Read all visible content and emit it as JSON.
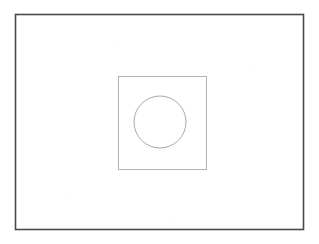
{
  "figure": {
    "background_color": "#ffffff",
    "canvas": {
      "width": 319,
      "height": 244
    },
    "shapes": [
      {
        "name": "outer-rectangle",
        "type": "rect",
        "x": 15.5,
        "y": 14.5,
        "width": 288,
        "height": 215,
        "stroke_color": "#4a4a4a",
        "stroke_width": 1.6,
        "fill": "none"
      },
      {
        "name": "inner-square",
        "type": "rect",
        "x": 118.5,
        "y": 76.5,
        "width": 88,
        "height": 93,
        "stroke_color": "#b2b2b2",
        "stroke_width": 1.0,
        "fill": "none"
      },
      {
        "name": "inner-circle",
        "type": "circle",
        "cx": 160,
        "cy": 122,
        "r": 26,
        "stroke_color": "#a8a8a8",
        "stroke_width": 1.0,
        "fill": "none"
      }
    ]
  }
}
